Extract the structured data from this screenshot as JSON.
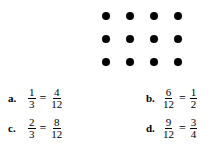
{
  "dot_grid": {
    "rows": 3,
    "cols": 4,
    "color": "#000000"
  },
  "problems": [
    {
      "label": "a.",
      "left": {
        "num": "1",
        "den": "3"
      },
      "eq": "=",
      "right": {
        "num": "4",
        "den": "12"
      }
    },
    {
      "label": "b.",
      "left": {
        "num": "6",
        "den": "12"
      },
      "eq": "=",
      "right": {
        "num": "1",
        "den": "2"
      }
    },
    {
      "label": "c.",
      "left": {
        "num": "2",
        "den": "3"
      },
      "eq": "=",
      "right": {
        "num": "8",
        "den": "12"
      }
    },
    {
      "label": "d.",
      "left": {
        "num": "9",
        "den": "12"
      },
      "eq": "=",
      "right": {
        "num": "3",
        "den": "4"
      }
    }
  ]
}
